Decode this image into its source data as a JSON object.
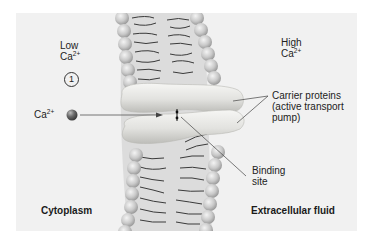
{
  "diagram": {
    "type": "membrane-transport-illustration",
    "topic": "Active transport of Ca2+ via carrier proteins",
    "colors": {
      "background": "#f1f1f1",
      "lipid_head": "#c8c8c8",
      "lipid_tail": "#3a3a3a",
      "protein": "#e4e4e2",
      "ion": "#6a6a6a"
    }
  },
  "labels": {
    "low_line1": "Low",
    "low_ion": "Ca",
    "low_charge": "2+",
    "high_line1": "High",
    "high_ion": "Ca",
    "high_charge": "2+",
    "step_number": "1",
    "ion_label": "Ca",
    "ion_charge": "2+",
    "carrier_line1": "Carrier proteins",
    "carrier_line2": "(active transport",
    "carrier_line3": "pump)",
    "binding_line1": "Binding",
    "binding_line2": "site",
    "cytoplasm": "Cytoplasm",
    "extracellular": "Extracellular fluid"
  }
}
